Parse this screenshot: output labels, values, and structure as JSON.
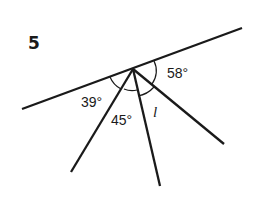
{
  "problem_number": "5",
  "labels": {
    "angle_a": "39°",
    "angle_b": "45°",
    "angle_c": "l",
    "angle_d": "58°"
  },
  "colors": {
    "ink": "#1a1a1a",
    "background": "#ffffff"
  }
}
